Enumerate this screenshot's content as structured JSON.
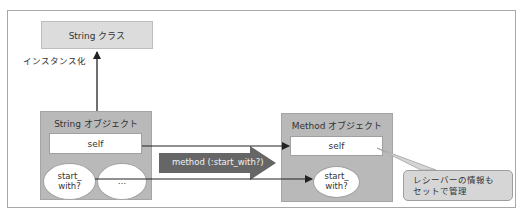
{
  "diagram": {
    "class_box": {
      "label": "String クラス"
    },
    "instantiate_label": "インスタンス化",
    "string_object": {
      "title": "String オブジェクト",
      "self_label": "self",
      "method_oval": "start_\nwith?",
      "other_oval": "…"
    },
    "method_call_arrow": {
      "label": "method (:start_with?)"
    },
    "method_object": {
      "title": "Method オブジェクト",
      "self_label": "self",
      "method_oval": "start_\nwith?"
    },
    "callout": {
      "text": "レシーバーの情報も\nセットで管理"
    },
    "colors": {
      "class_box": "#dcdcdc",
      "object_box": "#b9b9b9",
      "fat_arrow": "#666666",
      "callout": "#d6d6d6",
      "arrow_line": "#222222"
    }
  }
}
